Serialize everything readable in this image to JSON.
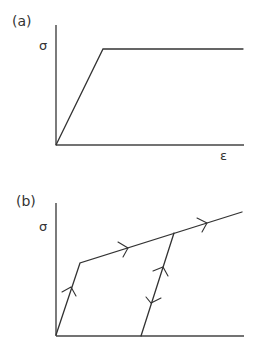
{
  "panels": [
    {
      "label": "(a)",
      "y_axis_label": "σ",
      "x_axis_label": "ε",
      "description": "elastic-perfectly plastic stress-strain curve"
    },
    {
      "label": "(b)",
      "y_axis_label": "σ",
      "description": "elastic-linear hardening stress-strain curve with unloading/reloading path"
    }
  ],
  "colors": {
    "line": "#333333",
    "background": "#ffffff"
  }
}
